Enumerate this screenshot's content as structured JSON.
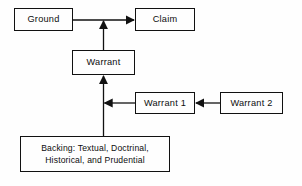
{
  "diagram": {
    "colors": {
      "stroke": "#111111",
      "background": "#fefefe",
      "text": "#0d0d0d"
    },
    "nodes": [
      {
        "id": "ground",
        "label": "Ground"
      },
      {
        "id": "claim",
        "label": "Claim"
      },
      {
        "id": "warrant",
        "label": "Warrant"
      },
      {
        "id": "warrant1",
        "label": "Warrant 1"
      },
      {
        "id": "warrant2",
        "label": "Warrant 2"
      },
      {
        "id": "backing",
        "label": "Backing: Textual, Doctrinal,\nHistorical, and  Prudential"
      }
    ],
    "edges": [
      {
        "id": "ground-to-claim",
        "from": "ground",
        "to": "claim",
        "direction": "right"
      },
      {
        "id": "warrant-to-link",
        "from": "warrant",
        "to": "ground-to-claim",
        "direction": "up"
      },
      {
        "id": "warrant1-to-warrant",
        "from": "warrant1",
        "to": "warrant",
        "direction": "left"
      },
      {
        "id": "warrant2-to-warrant1",
        "from": "warrant2",
        "to": "warrant1",
        "direction": "left"
      },
      {
        "id": "backing-to-warrant",
        "from": "backing",
        "to": "warrant",
        "direction": "up"
      }
    ]
  }
}
